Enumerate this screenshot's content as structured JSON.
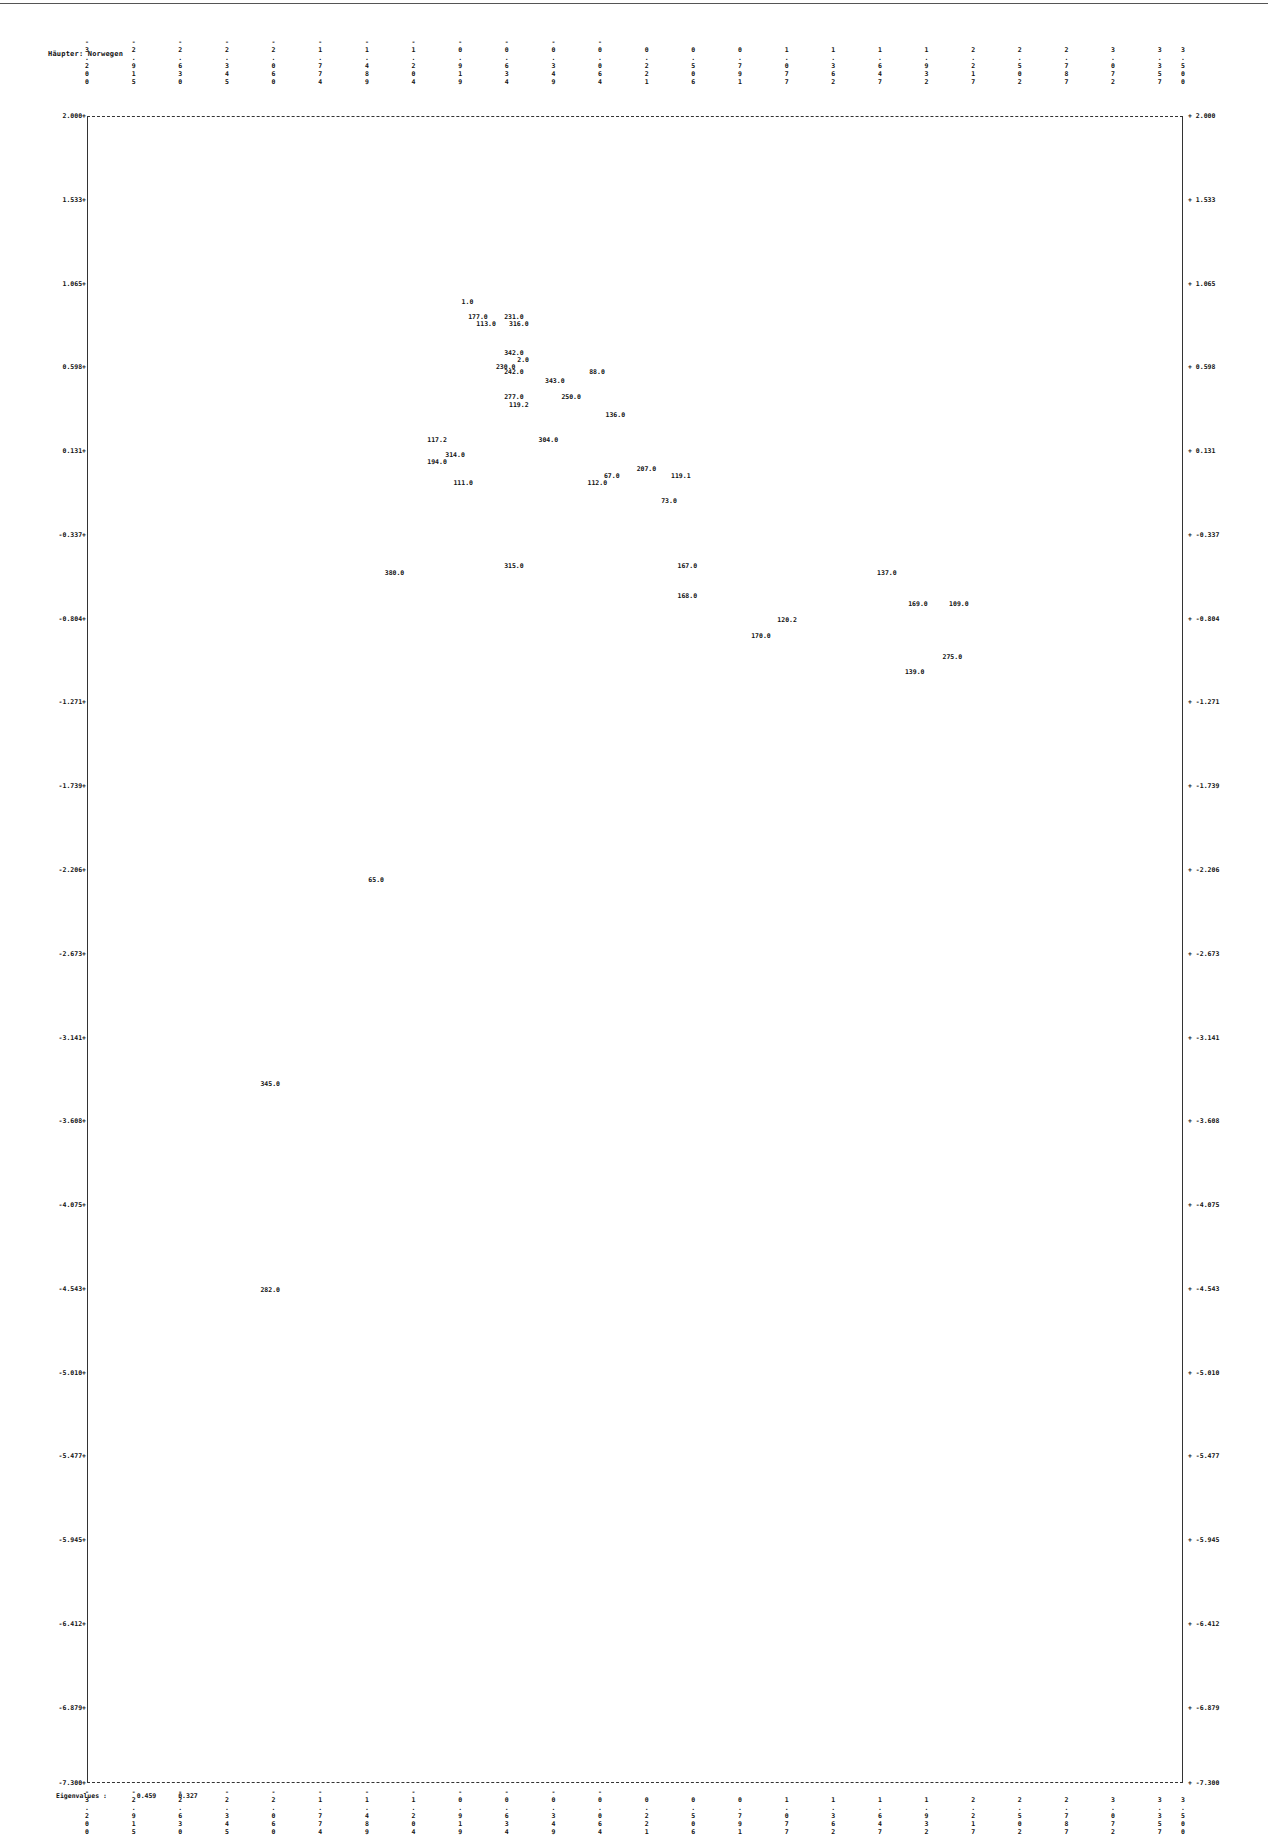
{
  "title": "Häupter: Norwegen",
  "footer": {
    "label": "Eigenvalues :",
    "values": [
      "0.459",
      "0.327"
    ]
  },
  "chart_data": {
    "type": "scatter",
    "title": "Häupter: Norwegen",
    "xlabel": "",
    "ylabel": "",
    "xlim": [
      -3.2,
      3.5
    ],
    "ylim": [
      -7.3,
      2.0
    ],
    "grid": false,
    "x_ticks": [
      "-3.200",
      "-2.915",
      "-2.630",
      "-2.345",
      "-2.060",
      "-1.774",
      "-1.489",
      "-1.204",
      "-0.919",
      "-0.634",
      "-0.349",
      "-0.064",
      "0.221",
      "0.506",
      "0.791",
      "1.077",
      "1.362",
      "1.647",
      "1.932",
      "2.217",
      "2.502",
      "2.787",
      "3.072",
      "3.357",
      "3.500"
    ],
    "y_ticks": [
      "2.000",
      "1.533",
      "1.065",
      "0.598",
      "0.131",
      "-0.337",
      "-0.804",
      "-1.271",
      "-1.739",
      "-2.206",
      "-2.673",
      "-3.141",
      "-3.608",
      "-4.075",
      "-4.543",
      "-5.010",
      "-5.477",
      "-5.945",
      "-6.412",
      "-6.879",
      "-7.300"
    ],
    "points": [
      {
        "label": "1.0",
        "x": -0.91,
        "y": 0.96
      },
      {
        "label": "177.0",
        "x": -0.87,
        "y": 0.88
      },
      {
        "label": "231.0",
        "x": -0.65,
        "y": 0.88
      },
      {
        "label": "113.0",
        "x": -0.82,
        "y": 0.84
      },
      {
        "label": "316.0",
        "x": -0.62,
        "y": 0.84
      },
      {
        "label": "342.0",
        "x": -0.65,
        "y": 0.68
      },
      {
        "label": "2.0",
        "x": -0.57,
        "y": 0.64
      },
      {
        "label": "230.0",
        "x": -0.7,
        "y": 0.6
      },
      {
        "label": "242.0",
        "x": -0.65,
        "y": 0.57
      },
      {
        "label": "88.0",
        "x": -0.13,
        "y": 0.57
      },
      {
        "label": "343.0",
        "x": -0.4,
        "y": 0.52
      },
      {
        "label": "277.0",
        "x": -0.65,
        "y": 0.43
      },
      {
        "label": "250.0",
        "x": -0.3,
        "y": 0.43
      },
      {
        "label": "119.2",
        "x": -0.62,
        "y": 0.39
      },
      {
        "label": "136.0",
        "x": -0.03,
        "y": 0.33
      },
      {
        "label": "117.2",
        "x": -1.12,
        "y": 0.19
      },
      {
        "label": "304.0",
        "x": -0.44,
        "y": 0.19
      },
      {
        "label": "314.0",
        "x": -1.01,
        "y": 0.11
      },
      {
        "label": "194.0",
        "x": -1.12,
        "y": 0.07
      },
      {
        "label": "207.0",
        "x": 0.16,
        "y": 0.03
      },
      {
        "label": "67.0",
        "x": -0.04,
        "y": -0.01
      },
      {
        "label": "119.1",
        "x": 0.37,
        "y": -0.01
      },
      {
        "label": "111.0",
        "x": -0.96,
        "y": -0.05
      },
      {
        "label": "112.0",
        "x": -0.14,
        "y": -0.05
      },
      {
        "label": "73.0",
        "x": 0.31,
        "y": -0.15
      },
      {
        "label": "315.0",
        "x": -0.65,
        "y": -0.51
      },
      {
        "label": "167.0",
        "x": 0.41,
        "y": -0.51
      },
      {
        "label": "380.0",
        "x": -1.38,
        "y": -0.55
      },
      {
        "label": "137.0",
        "x": 1.63,
        "y": -0.55
      },
      {
        "label": "168.0",
        "x": 0.41,
        "y": -0.68
      },
      {
        "label": "169.0",
        "x": 1.82,
        "y": -0.72
      },
      {
        "label": "109.0",
        "x": 2.07,
        "y": -0.72
      },
      {
        "label": "120.2",
        "x": 1.02,
        "y": -0.81
      },
      {
        "label": "170.0",
        "x": 0.86,
        "y": -0.9
      },
      {
        "label": "275.0",
        "x": 2.03,
        "y": -1.02
      },
      {
        "label": "139.0",
        "x": 1.8,
        "y": -1.1
      },
      {
        "label": "65.0",
        "x": -1.48,
        "y": -2.26
      },
      {
        "label": "345.0",
        "x": -2.14,
        "y": -3.4
      },
      {
        "label": "282.0",
        "x": -2.14,
        "y": -4.55
      }
    ],
    "legend": null,
    "annotations": [
      "Eigenvalues : 0.459 0.327"
    ]
  }
}
